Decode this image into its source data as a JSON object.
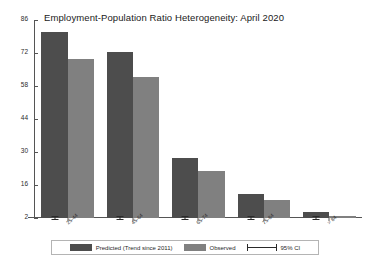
{
  "chart_data": {
    "type": "bar",
    "title": "Employment-Population Ratio Heterogeneity: April 2020",
    "xlabel": "",
    "ylabel": "",
    "ylim": [
      2,
      86
    ],
    "yticks": [
      2,
      16,
      30,
      44,
      58,
      72,
      86
    ],
    "grid": false,
    "legend_position": "bottom",
    "categories": [
      "25-44",
      "45-64",
      "65-74",
      "75-84",
      "> 84"
    ],
    "series": [
      {
        "name": "Predicted (Trend since 2011)",
        "color": "#4d4d4d",
        "values": [
          81.0,
          72.5,
          27.5,
          12.0,
          4.5
        ],
        "ci_low": [
          80.0,
          71.5,
          26.5,
          11.0,
          3.6
        ],
        "ci_high": [
          82.0,
          73.5,
          28.5,
          13.0,
          5.4
        ]
      },
      {
        "name": "Observed",
        "color": "#808080",
        "values": [
          69.5,
          62.0,
          22.0,
          9.5,
          2.8
        ]
      }
    ],
    "error_bar_label": "95% CI"
  },
  "legend": {
    "predicted_label": "Predicted (Trend since 2011)",
    "observed_label": "Observed",
    "ci_label": "95% CI"
  }
}
